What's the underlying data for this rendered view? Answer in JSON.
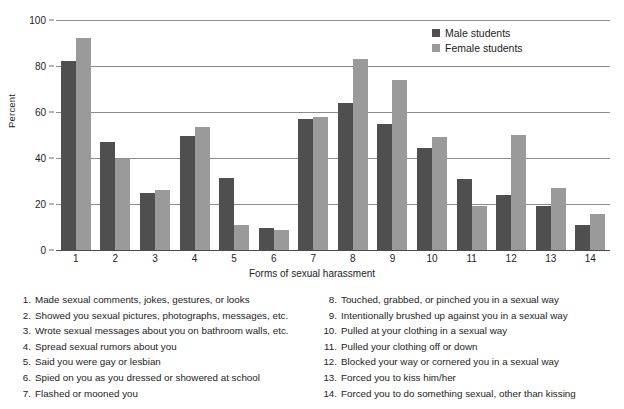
{
  "chart_data": {
    "type": "bar",
    "title": "",
    "xlabel": "Forms of sexual harassment",
    "ylabel": "Percent",
    "ylim": [
      0,
      100
    ],
    "yticks": [
      0,
      20,
      40,
      60,
      80,
      100
    ],
    "grid": true,
    "legend_position": "top-right",
    "categories": [
      "1",
      "2",
      "3",
      "4",
      "5",
      "6",
      "7",
      "8",
      "9",
      "10",
      "11",
      "12",
      "13",
      "14"
    ],
    "series": [
      {
        "name": "Male students",
        "color": "#4f4f4f",
        "values": [
          82,
          47,
          25,
          49.5,
          31.5,
          9.5,
          57,
          64,
          55,
          44.5,
          31,
          24,
          19,
          11
        ]
      },
      {
        "name": "Female students",
        "color": "#9a9a9a",
        "values": [
          92,
          39.5,
          26,
          53.5,
          11,
          8.5,
          58,
          83,
          74,
          49,
          19,
          50,
          27,
          15.5
        ]
      }
    ],
    "category_key": [
      {
        "num": "1.",
        "text": "Made sexual comments, jokes, gestures, or looks"
      },
      {
        "num": "2.",
        "text": "Showed you sexual pictures, photographs, messages, etc."
      },
      {
        "num": "3.",
        "text": "Wrote sexual messages about you on bathroom walls, etc."
      },
      {
        "num": "4.",
        "text": "Spread sexual rumors about you"
      },
      {
        "num": "5.",
        "text": "Said you were gay or lesbian"
      },
      {
        "num": "6.",
        "text": "Spied on you as you dressed or showered at school"
      },
      {
        "num": "7.",
        "text": "Flashed or mooned you"
      },
      {
        "num": "8.",
        "text": "Touched, grabbed, or pinched you in a sexual way"
      },
      {
        "num": "9.",
        "text": "Intentionally brushed up against you in a sexual way"
      },
      {
        "num": "10.",
        "text": "Pulled at your clothing in a sexual way"
      },
      {
        "num": "11.",
        "text": "Pulled your clothing off or down"
      },
      {
        "num": "12.",
        "text": "Blocked your way or cornered you in a sexual way"
      },
      {
        "num": "13.",
        "text": "Forced you to kiss him/her"
      },
      {
        "num": "14.",
        "text": "Forced you to do something sexual, other than kissing"
      }
    ]
  }
}
